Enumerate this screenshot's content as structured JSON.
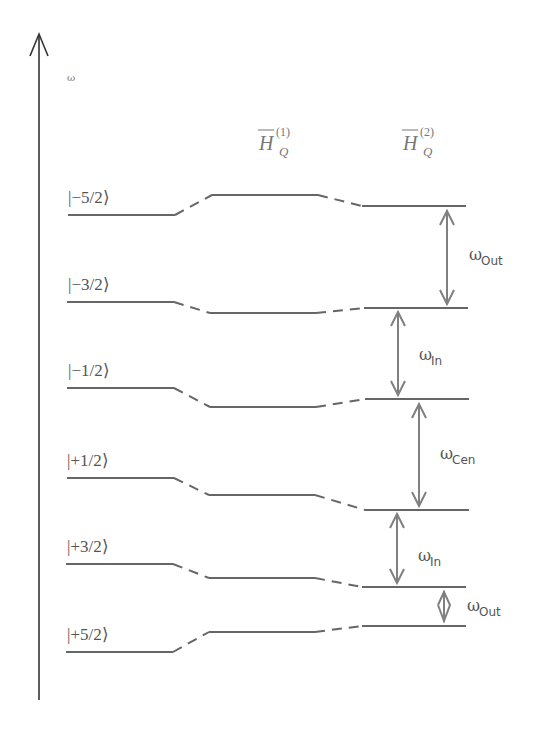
{
  "diagram": {
    "axis": {
      "label": "ω"
    },
    "columns": [
      {
        "title": "",
        "sup": "",
        "sub": ""
      },
      {
        "title": "H",
        "sup": "(1)",
        "sub": "Q"
      },
      {
        "title": "H",
        "sup": "(2)",
        "sub": "Q"
      }
    ],
    "states": [
      "|−5/2⟩",
      "|−3/2⟩",
      "|−1/2⟩",
      "|+1/2⟩",
      "|+3/2⟩",
      "|+5/2⟩"
    ],
    "levels_y": {
      "unperturbed": [
        215,
        302,
        388,
        478,
        564,
        652
      ],
      "first_order": [
        195,
        313,
        407,
        495,
        578,
        632
      ],
      "second_order": [
        206,
        308,
        399,
        510,
        587,
        626
      ]
    },
    "transitions": [
      {
        "symbol": "ω",
        "sub": "Out",
        "from": "|−5/2⟩",
        "to": "|−3/2⟩"
      },
      {
        "symbol": "ω",
        "sub": "In",
        "from": "|−3/2⟩",
        "to": "|−1/2⟩"
      },
      {
        "symbol": "ω",
        "sub": "Cen",
        "from": "|−1/2⟩",
        "to": "|+1/2⟩"
      },
      {
        "symbol": "ω",
        "sub": "In",
        "from": "|+1/2⟩",
        "to": "|+3/2⟩"
      },
      {
        "symbol": "ω",
        "sub": "Out",
        "from": "|+3/2⟩",
        "to": "|+5/2⟩"
      }
    ],
    "colors": {
      "line": "#666666",
      "arrow": "#808080",
      "text": "#555555"
    }
  }
}
